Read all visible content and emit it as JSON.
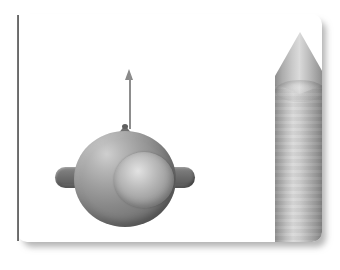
{
  "scene": {
    "title": "Technical illustration: sphere with lifting arrow and pointed cylinder",
    "background_color": "#ffffff",
    "card": {
      "name": "illustration-frame",
      "fill_color": "#ffffff",
      "corner_radius": "10px",
      "shadow_color": "#787878"
    },
    "left_rule": {
      "name": "vertical-rule",
      "color": "#4a4a4a"
    },
    "objects": [
      {
        "id": "ring-sphere-assembly",
        "label": "Ring with inner sphere and two side lobes",
        "shading": "grayscale-3d",
        "base_color": "#888888",
        "highlight_color": "#cfcfcf",
        "shadow_color": "#6a6a6a",
        "parts": [
          {
            "id": "outer-torus",
            "label": "Outer ring",
            "color": "#888888"
          },
          {
            "id": "inner-sphere",
            "label": "Inner sphere",
            "color": "#bdbdbd"
          },
          {
            "id": "lobe-left",
            "label": "Left lobe",
            "color": "#6d6d6d"
          },
          {
            "id": "lobe-right",
            "label": "Right lobe",
            "color": "#6a6a6a"
          },
          {
            "id": "top-nub",
            "label": "Top nub",
            "color": "#707070"
          }
        ]
      },
      {
        "id": "direction-arrow",
        "label": "Upward direction arrow",
        "direction": "up",
        "color": "#8a8a8a"
      },
      {
        "id": "pointed-cylinder",
        "label": "Cylinder with conical tip",
        "base_color": "#b5b5b5",
        "highlight_color": "#dadada",
        "shadow_color": "#838383",
        "parts": [
          {
            "id": "cone-tip",
            "label": "Conical tip",
            "color": "#a8a8a8"
          },
          {
            "id": "cyl-barrel",
            "label": "Cylinder barrel",
            "color": "#c2c2c2"
          },
          {
            "id": "cone-seam",
            "label": "Cone/barrel seam",
            "color": "#bebebe"
          }
        ]
      }
    ]
  }
}
